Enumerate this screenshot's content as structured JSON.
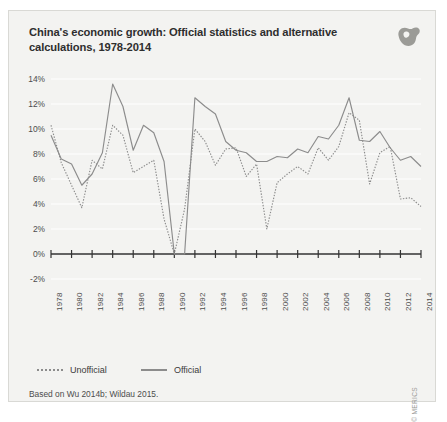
{
  "figure": {
    "title": "China's economic growth: Official statistics and alternative calculations, 1978-2014",
    "source_note": "Based on Wu 2014b; Wildau 2015.",
    "copyright": "© MERICS",
    "logo_name": "merics-logo",
    "background_color": "#f3f3f1",
    "line_color": "#8c8c8c",
    "text_color": "#2e2e2e"
  },
  "chart_data": {
    "type": "line",
    "title": "China's economic growth: Official statistics and alternative calculations, 1978-2014",
    "xlabel": "",
    "ylabel": "",
    "ylim": [
      -2,
      14
    ],
    "ytick_labels": [
      "14%",
      "12%",
      "10%",
      "8%",
      "6%",
      "4%",
      "2%",
      "0%",
      "-2%"
    ],
    "ytick_values": [
      14,
      12,
      10,
      8,
      6,
      4,
      2,
      0,
      -2
    ],
    "grid": true,
    "legend_position": "bottom-left",
    "x": [
      1978,
      1979,
      1980,
      1981,
      1982,
      1983,
      1984,
      1985,
      1986,
      1987,
      1988,
      1989,
      1990,
      1991,
      1992,
      1993,
      1994,
      1995,
      1996,
      1997,
      1998,
      1999,
      2000,
      2001,
      2002,
      2003,
      2004,
      2005,
      2006,
      2007,
      2008,
      2009,
      2010,
      2011,
      2012,
      2013,
      2014
    ],
    "xtick_labels": [
      "1978",
      "1980",
      "1982",
      "1984",
      "1986",
      "1988",
      "1990",
      "1992",
      "1994",
      "1996",
      "1998",
      "2000",
      "2002",
      "2004",
      "2006",
      "2008",
      "2010",
      "2012",
      "2014"
    ],
    "series": [
      {
        "name": "Unofficial",
        "style": "dotted",
        "values": [
          10.3,
          7.3,
          5.5,
          3.7,
          7.5,
          6.8,
          10.3,
          9.5,
          6.5,
          7.0,
          7.5,
          2.8,
          0.0,
          3.6,
          10.0,
          9.0,
          7.1,
          8.4,
          8.5,
          6.2,
          7.2,
          2.0,
          5.7,
          6.4,
          7.0,
          6.4,
          8.5,
          7.5,
          8.6,
          11.3,
          10.7,
          5.6,
          8.1,
          8.6,
          4.4,
          4.5,
          3.8
        ]
      },
      {
        "name": "Official",
        "style": "solid",
        "values": [
          9.5,
          7.6,
          7.2,
          5.5,
          6.4,
          8.1,
          13.6,
          11.8,
          8.3,
          10.3,
          9.7,
          7.4,
          0.0,
          0.0,
          12.5,
          11.8,
          11.2,
          9.0,
          8.3,
          8.1,
          7.4,
          7.4,
          7.8,
          7.7,
          8.4,
          8.1,
          9.4,
          9.2,
          10.3,
          12.5,
          9.1,
          9.0,
          9.8,
          8.5,
          7.5,
          7.8,
          7.0
        ]
      }
    ],
    "legend": [
      {
        "label": "Unofficial",
        "style": "dotted"
      },
      {
        "label": "Official",
        "style": "solid"
      }
    ]
  }
}
